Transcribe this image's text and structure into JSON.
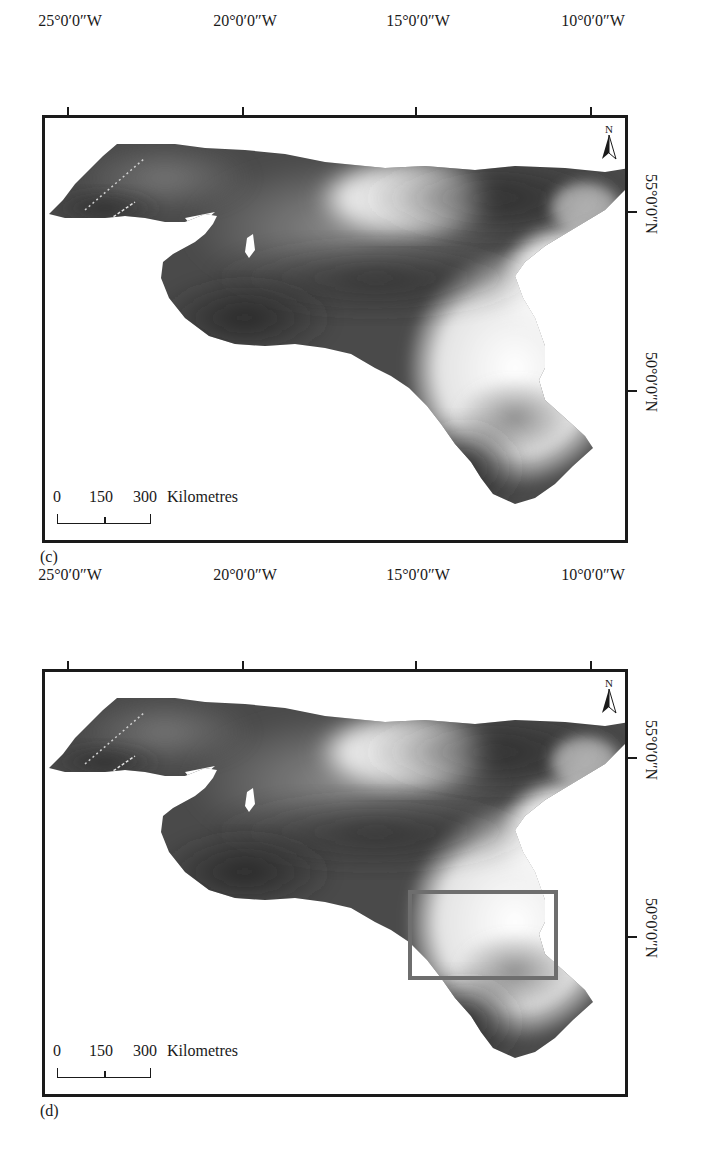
{
  "figure": {
    "panels": [
      {
        "id": "c",
        "caption": "(c)",
        "longitude_labels": [
          "25°0′0″W",
          "20°0′0″W",
          "15°0′0″W",
          "10°0′0″W"
        ],
        "latitude_labels": [
          "55°0′0″N",
          "50°0′0″N"
        ],
        "north_arrow": {
          "icon": "north-arrow-icon",
          "label": "N"
        },
        "scale_bar": {
          "ticks": [
            "0",
            "150",
            "300"
          ],
          "unit": "Kilometres"
        },
        "highlight_box": false
      },
      {
        "id": "d",
        "caption": "(d)",
        "longitude_labels": [
          "25°0′0″W",
          "20°0′0″W",
          "15°0′0″W",
          "10°0′0″W"
        ],
        "latitude_labels": [
          "55°0′0″N",
          "50°0′0″N"
        ],
        "north_arrow": {
          "icon": "north-arrow-icon",
          "label": "N"
        },
        "scale_bar": {
          "ticks": [
            "0",
            "150",
            "300"
          ],
          "unit": "Kilometres"
        },
        "highlight_box": true,
        "highlight_box_color": "#6e6e6e"
      }
    ],
    "colors": {
      "frame": "#1a1a1a",
      "shallow": "#f2f2f2",
      "mid": "#8a8a8a",
      "deep": "#1e1e1e"
    }
  }
}
